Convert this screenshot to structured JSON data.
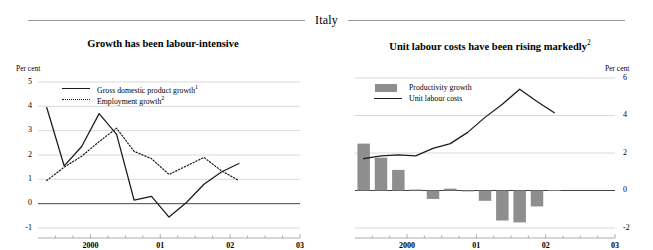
{
  "header": {
    "country": "Italy"
  },
  "panels": [
    {
      "id": "left",
      "title": "Growth has been labour-intensive",
      "axis_unit": "Per cent",
      "legend": [
        {
          "label": "Gross domestic product growth",
          "note": "1",
          "style": "solid"
        },
        {
          "label": "Employment growth",
          "note": "2",
          "style": "dotted"
        }
      ]
    },
    {
      "id": "right",
      "title": "Unit labour costs have been rising markedly",
      "title_note": "2",
      "axis_unit": "Per cent",
      "legend": [
        {
          "label": "Productivity growth",
          "style": "swatch"
        },
        {
          "label": "Unit labour costs",
          "style": "solid"
        }
      ]
    }
  ],
  "chart_data": [
    {
      "type": "line",
      "panel": "left",
      "title": "Growth has been labour-intensive",
      "xlabel": "",
      "ylabel": "Per cent",
      "ylim": [
        -1,
        5
      ],
      "yticks": [
        5,
        4,
        3,
        2,
        1,
        0,
        -1
      ],
      "ytick_labels": [
        "5",
        "4",
        "3",
        "2",
        "1",
        "0",
        "-1"
      ],
      "xlim": [
        1999.25,
        2003.0
      ],
      "xticks": [
        2000,
        2001,
        2002,
        2003
      ],
      "xtick_labels": [
        "2000",
        "01",
        "02",
        "03"
      ],
      "grid": "horizontal",
      "legend_position": "upper-left-inside",
      "x": [
        1999.375,
        1999.625,
        1999.875,
        2000.125,
        2000.375,
        2000.625,
        2000.875,
        2001.125,
        2001.375,
        2001.625,
        2001.875,
        2002.125,
        2002.375,
        2002.625
      ],
      "series": [
        {
          "name": "Gross domestic product growth",
          "note": "1",
          "style": "solid",
          "color": "#1a1a1a",
          "values": [
            3.95,
            1.55,
            2.35,
            3.7,
            2.85,
            0.15,
            0.3,
            -0.55,
            0.05,
            0.8,
            1.3,
            1.65
          ]
        },
        {
          "name": "Employment growth",
          "note": "2",
          "style": "dotted",
          "color": "#1a1a1a",
          "values": [
            0.95,
            1.5,
            1.95,
            2.55,
            3.1,
            2.15,
            1.85,
            1.2,
            1.55,
            1.9,
            1.35,
            0.95
          ]
        }
      ]
    },
    {
      "type": "bar-line",
      "panel": "right",
      "title": "Unit labour costs have been rising markedly",
      "title_note": "2",
      "xlabel": "",
      "ylabel": "Per cent",
      "ylim": [
        -2,
        6
      ],
      "yticks": [
        6,
        4,
        2,
        0,
        -2
      ],
      "ytick_labels": [
        "6",
        "4",
        "2",
        "0",
        "-2"
      ],
      "xlim": [
        1999.25,
        2003.0
      ],
      "xticks": [
        2000,
        2001,
        2002,
        2003
      ],
      "xtick_labels": [
        "2000",
        "01",
        "02",
        "03"
      ],
      "grid": "horizontal",
      "legend_position": "upper-left-inside",
      "x": [
        1999.375,
        1999.625,
        1999.875,
        2000.125,
        2000.375,
        2000.625,
        2000.875,
        2001.125,
        2001.375,
        2001.625,
        2001.875,
        2002.125
      ],
      "series": [
        {
          "name": "Productivity growth",
          "style": "bar",
          "color": "#8e8e8e",
          "values": [
            2.5,
            1.75,
            1.1,
            0.05,
            -0.45,
            0.1,
            -0.05,
            -0.55,
            -1.6,
            -1.7,
            -0.85,
            0.02
          ]
        },
        {
          "name": "Unit labour costs",
          "style": "line",
          "color": "#1a1a1a",
          "values": [
            1.7,
            1.85,
            1.9,
            1.85,
            2.25,
            2.5,
            3.1,
            3.9,
            4.6,
            5.4,
            4.75,
            4.15
          ]
        }
      ]
    }
  ]
}
